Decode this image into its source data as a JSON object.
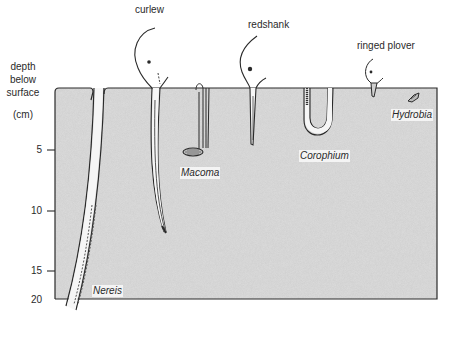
{
  "axis": {
    "title_lines": [
      "depth",
      "below",
      "surface"
    ],
    "unit": "(cm)",
    "ticks": [
      {
        "value": "5",
        "y": 150
      },
      {
        "value": "10",
        "y": 211
      },
      {
        "value": "15",
        "y": 271
      },
      {
        "value": "20",
        "y": 299
      }
    ]
  },
  "birds": [
    {
      "name": "curlew",
      "bill_depth_cm": 12
    },
    {
      "name": "redshank",
      "bill_depth_cm": 4.5
    },
    {
      "name": "ringed plover",
      "bill_depth_cm": 1
    }
  ],
  "prey": [
    {
      "name": "Nereis",
      "depth_cm": "0–18"
    },
    {
      "name": "Macoma",
      "depth_cm": 5
    },
    {
      "name": "Corophium",
      "depth_cm": "0–4"
    },
    {
      "name": "Hydrobia",
      "depth_cm": 0.5
    }
  ],
  "colors": {
    "mud": "#dcdcdc",
    "outline": "#2a2a2a",
    "background": "#ffffff"
  }
}
